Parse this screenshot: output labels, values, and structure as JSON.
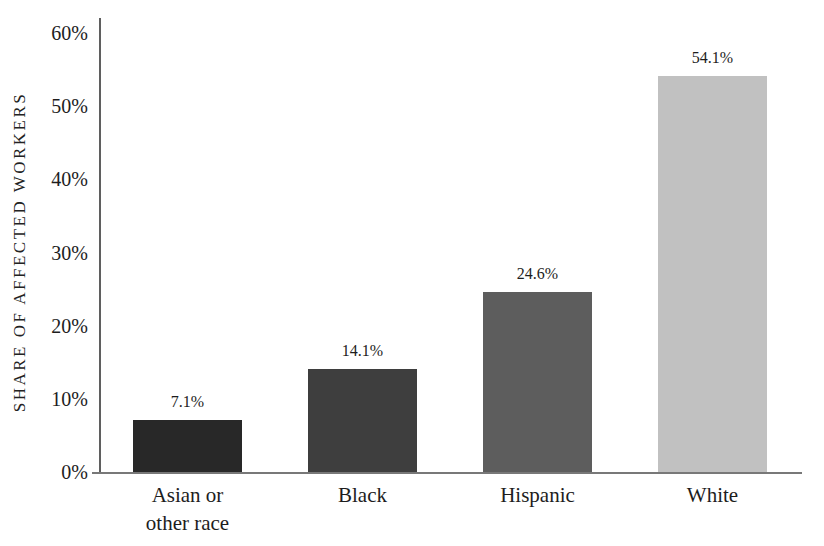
{
  "chart_data": {
    "type": "bar",
    "title": "",
    "xlabel": "",
    "ylabel": "SHARE OF AFFECTED WORKERS",
    "categories": [
      "Asian or\nother race",
      "Black",
      "Hispanic",
      "White"
    ],
    "values": [
      7.1,
      14.1,
      24.6,
      54.1
    ],
    "value_labels": [
      "7.1%",
      "14.1%",
      "24.6%",
      "54.1%"
    ],
    "bar_colors": [
      "#282828",
      "#3e3e3e",
      "#5d5d5d",
      "#c1c1c1"
    ],
    "ylim": [
      0,
      60
    ],
    "ytick_step": 10,
    "ytick_labels": [
      "0%",
      "10%",
      "20%",
      "30%",
      "40%",
      "50%",
      "60%"
    ],
    "grid": false,
    "legend": null
  },
  "colors": {
    "background": "#ffffff",
    "text": "#1d1d1d",
    "y_axis_line": "#5f5f5f",
    "x_axis_line": "#787878"
  }
}
